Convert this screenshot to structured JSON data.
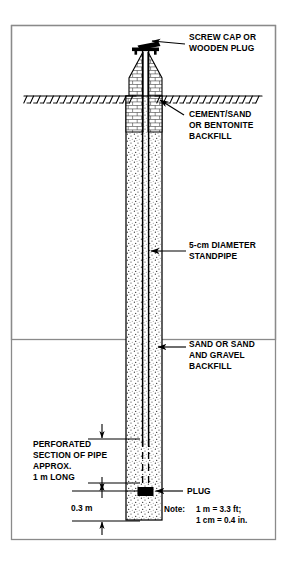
{
  "figure": {
    "title_visible": false,
    "border_color": "#808080",
    "ink_color": "#000000",
    "background": "#ffffff"
  },
  "labels": {
    "screw_cap": {
      "line1": "SCREW CAP OR",
      "line2": "WOODEN PLUG"
    },
    "cement_backfill": {
      "line1": "CEMENT/SAND",
      "line2": "OR BENTONITE",
      "line3": "BACKFILL"
    },
    "standpipe": {
      "line1": "5-cm DIAMETER",
      "line2": "STANDPIPE"
    },
    "sand_backfill": {
      "line1": "SAND OR SAND",
      "line2": "AND GRAVEL",
      "line3": "BACKFILL"
    },
    "perforated": {
      "line1": "PERFORATED",
      "line2": "SECTION OF PIPE",
      "line3": "APPROX.",
      "line4": "1 m LONG"
    },
    "plug": {
      "text": "PLUG"
    }
  },
  "dimensions": {
    "bottom_depth": "0.3 m"
  },
  "note": {
    "prefix": "Note:",
    "line1": "1 m = 3.3 ft;",
    "line2": "1 cm = 0.4 in."
  }
}
